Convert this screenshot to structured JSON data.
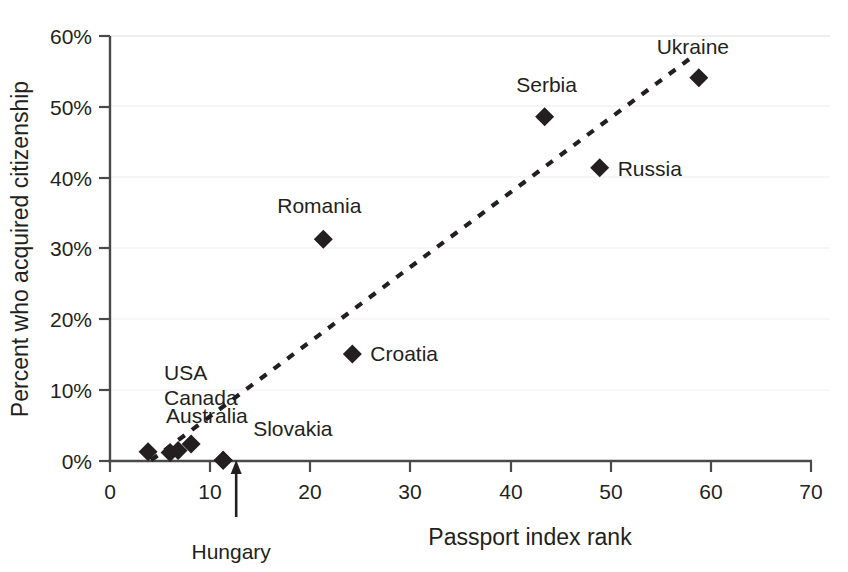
{
  "chart_data": {
    "type": "scatter",
    "title": "",
    "xlabel": "Passport index rank",
    "ylabel": "Percent who acquired citizenship",
    "xlim": [
      0,
      70
    ],
    "ylim": [
      0,
      60
    ],
    "xticks": [
      "0",
      "10",
      "20",
      "30",
      "40",
      "50",
      "60",
      "70"
    ],
    "xtick_values": [
      0,
      10,
      20,
      30,
      40,
      50,
      60,
      70
    ],
    "yticks": [
      "0%",
      "10%",
      "20%",
      "30%",
      "40%",
      "50%",
      "60%"
    ],
    "ytick_values": [
      0,
      10,
      20,
      30,
      40,
      50,
      60
    ],
    "grid": "horizontal-faint",
    "legend": "none",
    "marker": "diamond",
    "marker_color": "#231f20",
    "points": [
      {
        "label": "USA",
        "x": 3.8,
        "y": 1.3,
        "label_dx": 16,
        "label_dy": -72,
        "label_anchor": "start",
        "show_label": true
      },
      {
        "label": "Canada",
        "x": 6.0,
        "y": 1.2,
        "label_dx": -6,
        "label_dy": -48,
        "label_anchor": "start",
        "show_label": true
      },
      {
        "label": "Australia",
        "x": 6.8,
        "y": 1.5,
        "label_dx": -12,
        "label_dy": -27,
        "label_anchor": "start",
        "show_label": true
      },
      {
        "label": "",
        "x": 8.1,
        "y": 2.4,
        "label_dx": 0,
        "label_dy": 0,
        "label_anchor": "start",
        "show_label": false
      },
      {
        "label": "Hungary",
        "x": 11.3,
        "y": 0.1,
        "label_dx": 14,
        "label_dy": 72,
        "label_anchor": "middle",
        "show_label": false
      },
      {
        "label": "Slovakia",
        "x": 11.3,
        "y": 0.1,
        "label_dx": 30,
        "label_dy": -24,
        "label_anchor": "start",
        "show_label": true
      },
      {
        "label": "Romania",
        "x": 21.3,
        "y": 31.3,
        "label_dx": -4,
        "label_dy": -26,
        "label_anchor": "middle",
        "show_label": true
      },
      {
        "label": "Croatia",
        "x": 24.2,
        "y": 15.1,
        "label_dx": 18,
        "label_dy": 7,
        "label_anchor": "start",
        "show_label": true
      },
      {
        "label": "Serbia",
        "x": 43.4,
        "y": 48.6,
        "label_dx": 2,
        "label_dy": -25,
        "label_anchor": "middle",
        "show_label": true
      },
      {
        "label": "Russia",
        "x": 48.9,
        "y": 41.4,
        "label_dx": 18,
        "label_dy": 8,
        "label_anchor": "start",
        "show_label": true
      },
      {
        "label": "Ukraine",
        "x": 58.8,
        "y": 54.1,
        "label_dx": -6,
        "label_dy": -24,
        "label_anchor": "middle",
        "show_label": true
      }
    ],
    "trendline": {
      "style": "dashed",
      "x_start": 4.1,
      "y_start": 0.1,
      "x_end": 58.0,
      "y_end": 56.9
    },
    "annotations": [
      {
        "name": "hungary-callout",
        "text": "Hungary",
        "arrow_x": 12.6,
        "arrow_tip_y": 0,
        "arrow_tail_offset_px": 48,
        "text_offset_px": 70
      }
    ]
  }
}
